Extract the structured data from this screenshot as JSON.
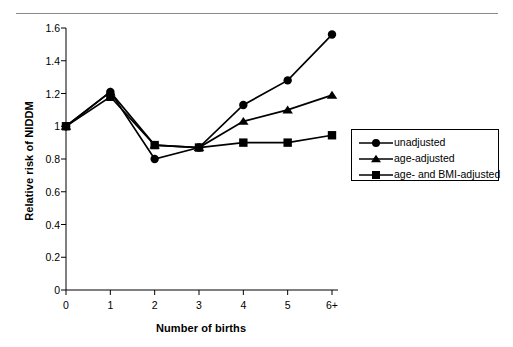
{
  "chart_data": {
    "type": "line",
    "title": "",
    "subtitle": "",
    "xlabel": "Number of births",
    "ylabel": "Relative risk of NIDDM",
    "categories": [
      "0",
      "1",
      "2",
      "3",
      "4",
      "5",
      "6+"
    ],
    "x_tick_labels": [
      "0",
      "1",
      "2",
      "3",
      "4",
      "5",
      "6+"
    ],
    "y_tick_labels": [
      "0",
      "0.2",
      "0.4",
      "0.6",
      "0.8",
      "1",
      "1.2",
      "1.4",
      "1.6"
    ],
    "y_tick_values": [
      0,
      0.2,
      0.4,
      0.6,
      0.8,
      1.0,
      1.2,
      1.4,
      1.6
    ],
    "ylim": [
      0,
      1.6
    ],
    "xlim": [
      0,
      6
    ],
    "grid": false,
    "legend_position": "right-middle",
    "series": [
      {
        "name": "unadjusted",
        "marker": "circle",
        "color": "#000000",
        "values": [
          1.0,
          1.21,
          0.8,
          0.87,
          1.13,
          1.28,
          1.56
        ]
      },
      {
        "name": "age-adjusted",
        "marker": "triangle",
        "color": "#000000",
        "values": [
          1.0,
          1.21,
          0.885,
          0.87,
          1.03,
          1.1,
          1.19
        ]
      },
      {
        "name": "age- and BMI-adjusted",
        "marker": "square",
        "color": "#000000",
        "values": [
          1.0,
          1.18,
          0.885,
          0.87,
          0.9,
          0.9,
          0.945
        ]
      }
    ]
  },
  "legend": {
    "items": [
      {
        "label": "unadjusted"
      },
      {
        "label": "age-adjusted"
      },
      {
        "label": "age- and BMI-adjusted"
      }
    ]
  },
  "axes": {
    "x_title": "Number of births",
    "y_title": "Relative risk of NIDDM"
  },
  "colors": {
    "ink": "#000000",
    "rule": "#8a8a8a",
    "background": "#ffffff"
  }
}
